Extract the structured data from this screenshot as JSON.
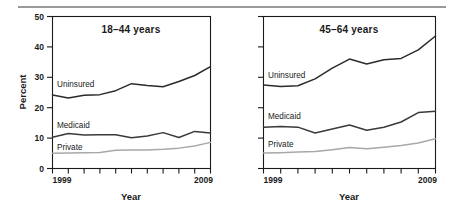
{
  "figure": {
    "has_top_rule": true,
    "background_color": "#ffffff"
  },
  "chart_data": [
    {
      "type": "line",
      "title": "18–44 years",
      "xlabel": "Year",
      "ylabel": "Percent",
      "xlim": [
        1999,
        2009
      ],
      "ylim": [
        0,
        50
      ],
      "yticks": [
        0,
        10,
        20,
        30,
        40,
        50
      ],
      "ytick_labels": [
        "0",
        "10",
        "20",
        "30",
        "40",
        "50"
      ],
      "xticks": [
        1999,
        2000,
        2001,
        2002,
        2003,
        2004,
        2005,
        2006,
        2007,
        2008,
        2009
      ],
      "xtick_labels": [
        "1999",
        "",
        "",
        "",
        "",
        "",
        "",
        "",
        "",
        "",
        "2009"
      ],
      "grid": false,
      "legend_position": "inline-labels",
      "x": [
        1999,
        2000,
        2001,
        2002,
        2003,
        2004,
        2005,
        2006,
        2007,
        2008,
        2009
      ],
      "series": [
        {
          "name": "Uninsured",
          "color": "#2b2b2b",
          "values": [
            24.2,
            23.2,
            24.1,
            24.3,
            25.6,
            27.9,
            27.3,
            26.9,
            28.6,
            30.6,
            33.5
          ]
        },
        {
          "name": "Medicaid",
          "color": "#3a3a3a",
          "values": [
            10.3,
            11.5,
            11.0,
            11.1,
            11.1,
            10.1,
            10.7,
            11.8,
            10.2,
            12.2,
            11.7
          ]
        },
        {
          "name": "Private",
          "color": "#a8a8a8",
          "values": [
            5.0,
            5.1,
            5.2,
            5.3,
            6.0,
            6.1,
            6.1,
            6.3,
            6.7,
            7.4,
            8.6
          ]
        }
      ]
    },
    {
      "type": "line",
      "title": "45–64 years",
      "xlabel": "Year",
      "ylabel": "",
      "xlim": [
        1999,
        2009
      ],
      "ylim": [
        0,
        50
      ],
      "yticks": [
        0,
        10,
        20,
        30,
        40,
        50
      ],
      "ytick_labels": [
        "",
        "",
        "",
        "",
        "",
        ""
      ],
      "xticks": [
        1999,
        2000,
        2001,
        2002,
        2003,
        2004,
        2005,
        2006,
        2007,
        2008,
        2009
      ],
      "xtick_labels": [
        "1999",
        "",
        "",
        "",
        "",
        "",
        "",
        "",
        "",
        "",
        "2009"
      ],
      "grid": false,
      "legend_position": "inline-labels",
      "x": [
        1999,
        2000,
        2001,
        2002,
        2003,
        2004,
        2005,
        2006,
        2007,
        2008,
        2009
      ],
      "series": [
        {
          "name": "Uninsured",
          "color": "#2b2b2b",
          "values": [
            27.5,
            27.0,
            27.2,
            29.5,
            33.0,
            36.0,
            34.4,
            35.8,
            36.2,
            39.0,
            43.6
          ]
        },
        {
          "name": "Medicaid",
          "color": "#3a3a3a",
          "values": [
            13.6,
            13.8,
            13.6,
            11.7,
            13.0,
            14.3,
            12.6,
            13.6,
            15.3,
            18.4,
            18.8
          ]
        },
        {
          "name": "Private",
          "color": "#a8a8a8",
          "values": [
            5.1,
            5.2,
            5.4,
            5.6,
            6.2,
            6.9,
            6.5,
            7.0,
            7.6,
            8.4,
            9.8
          ]
        }
      ]
    }
  ],
  "panels": [
    {
      "id": "left",
      "title": "18–44 years",
      "ylabel": "Percent",
      "xlabel": "Year",
      "x_start_label": "1999",
      "x_end_label": "2009",
      "series_labels": [
        "Uninsured",
        "Medicaid",
        "Private"
      ]
    },
    {
      "id": "right",
      "title": "45–64 years",
      "ylabel": "",
      "xlabel": "Year",
      "x_start_label": "1999",
      "x_end_label": "2009",
      "series_labels": [
        "Uninsured",
        "Medicaid",
        "Private"
      ]
    }
  ]
}
